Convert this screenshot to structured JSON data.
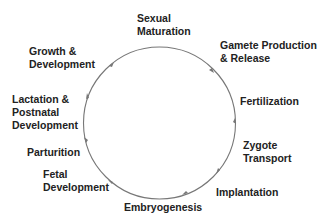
{
  "diagram": {
    "type": "cycle",
    "direction": "clockwise",
    "colors": {
      "text": "#222222",
      "circle": "#777777",
      "background": "#ffffff"
    },
    "stages": [
      {
        "id": "sexual-maturation",
        "lines": [
          "Sexual",
          "Maturation"
        ]
      },
      {
        "id": "gamete-production",
        "lines": [
          "Gamete Production",
          "& Release"
        ]
      },
      {
        "id": "fertilization",
        "lines": [
          "Fertilization"
        ]
      },
      {
        "id": "zygote-transport",
        "lines": [
          "Zygote",
          "Transport"
        ]
      },
      {
        "id": "implantation",
        "lines": [
          "Implantation"
        ]
      },
      {
        "id": "embryogenesis",
        "lines": [
          "Embryogenesis"
        ]
      },
      {
        "id": "fetal-development",
        "lines": [
          "Fetal",
          "Development"
        ]
      },
      {
        "id": "parturition",
        "lines": [
          "Parturition"
        ]
      },
      {
        "id": "lactation",
        "lines": [
          "Lactation &",
          "Postnatal",
          "Development"
        ]
      },
      {
        "id": "growth-development",
        "lines": [
          "Growth &",
          "Development"
        ]
      }
    ]
  }
}
